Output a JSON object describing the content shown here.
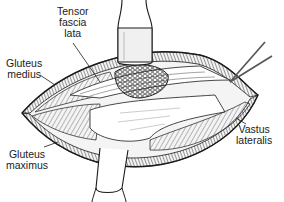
{
  "figure": {
    "labels": {
      "tensor_fascia_lata": {
        "lines": [
          "Tensor",
          "fascia",
          "lata"
        ]
      },
      "gluteus_medius": {
        "lines": [
          "Gluteus",
          "medius"
        ]
      },
      "gluteus_maximus": {
        "lines": [
          "Gluteus",
          "maximus"
        ]
      },
      "vastus_lateralis": {
        "lines": [
          "Vastus",
          "lateralis"
        ]
      }
    },
    "instruments": [
      "upper-retractor",
      "lower-retractor",
      "forceps"
    ],
    "colors": {
      "ink": "#1a1a1a",
      "background": "#ffffff",
      "shade": "#9a9a9a"
    }
  }
}
